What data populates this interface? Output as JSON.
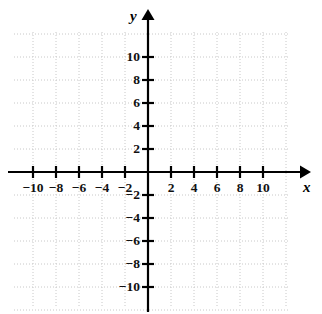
{
  "figure": {
    "axis_labels": {
      "x": "x",
      "y": "y"
    },
    "colors": {
      "axis": "#000000",
      "grid": "#c8c8c8",
      "label": "#111111",
      "background": "#ffffff"
    }
  },
  "chart_data": {
    "type": "scatter",
    "title": "",
    "subtitle": "",
    "xlabel": "x",
    "ylabel": "y",
    "xlim": [
      -11.7,
      13.6
    ],
    "ylim": [
      -12.0,
      13.9
    ],
    "xticks": [
      -10,
      -8,
      -6,
      -4,
      -2,
      2,
      4,
      6,
      8,
      10
    ],
    "yticks": [
      -10,
      -8,
      -6,
      -4,
      -2,
      2,
      4,
      6,
      8,
      10
    ],
    "xtick_labels": [
      "−10",
      "−8",
      "−6",
      "−4",
      "−2",
      "2",
      "4",
      "6",
      "8",
      "10"
    ],
    "ytick_labels": [
      "−10",
      "−8",
      "−6",
      "−4",
      "−2",
      "2",
      "4",
      "6",
      "8",
      "10"
    ],
    "tick_interval": 2,
    "grid": true,
    "grid_style": "dotted",
    "grid_interval": 2,
    "legend": false,
    "legend_position": "none",
    "series": [],
    "x": [],
    "values": [],
    "annotations": [],
    "axis_arrows": {
      "x_positive": true,
      "y_positive": true
    },
    "origin_label": ""
  },
  "ticks": {
    "x": [
      {
        "value": -10,
        "label": "−10"
      },
      {
        "value": -8,
        "label": "−8"
      },
      {
        "value": -6,
        "label": "−6"
      },
      {
        "value": -4,
        "label": "−4"
      },
      {
        "value": -2,
        "label": "−2"
      },
      {
        "value": 2,
        "label": "2"
      },
      {
        "value": 4,
        "label": "4"
      },
      {
        "value": 6,
        "label": "6"
      },
      {
        "value": 8,
        "label": "8"
      },
      {
        "value": 10,
        "label": "10"
      }
    ],
    "y": [
      {
        "value": 10,
        "label": "10"
      },
      {
        "value": 8,
        "label": "8"
      },
      {
        "value": 6,
        "label": "6"
      },
      {
        "value": 4,
        "label": "4"
      },
      {
        "value": 2,
        "label": "2"
      },
      {
        "value": -2,
        "label": "−2"
      },
      {
        "value": -4,
        "label": "−4"
      },
      {
        "value": -6,
        "label": "−6"
      },
      {
        "value": -8,
        "label": "−8"
      },
      {
        "value": -10,
        "label": "−10"
      }
    ]
  }
}
